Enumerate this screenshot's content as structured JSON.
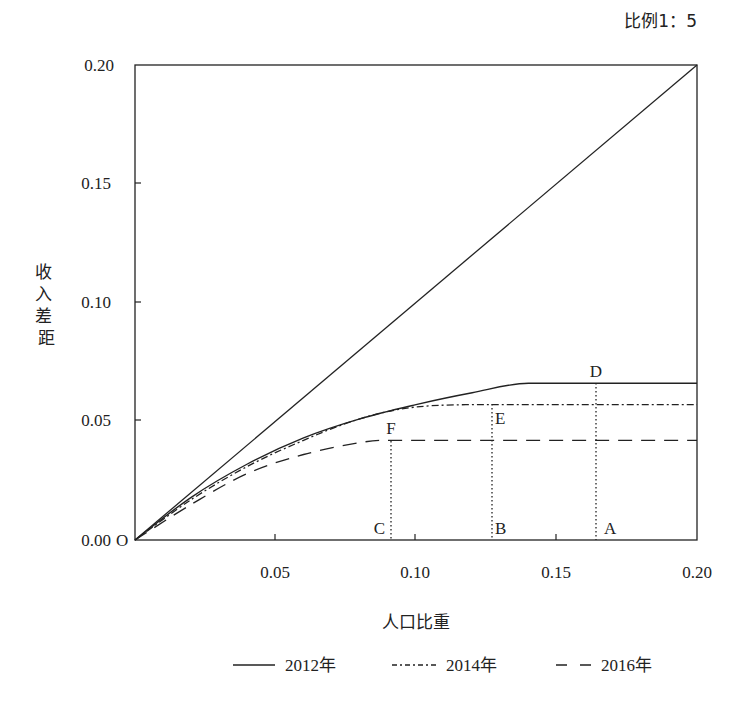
{
  "chart_data": {
    "type": "line",
    "title": "",
    "annotation_top_right": "比例1：5",
    "xlabel": "人口比重",
    "ylabel": "收入差距",
    "xlim": [
      0,
      0.2
    ],
    "ylim": [
      0,
      0.2
    ],
    "x_ticks": [
      "0.05",
      "0.10",
      "0.15",
      "0.20"
    ],
    "y_ticks": [
      "0.00",
      "0.05",
      "0.10",
      "0.15",
      "0.20"
    ],
    "origin_label": "O",
    "grid": false,
    "legend_position": "bottom",
    "reference_line": {
      "name": "比例1：5",
      "points": [
        [
          0,
          0
        ],
        [
          0.2,
          0.2
        ]
      ]
    },
    "series": [
      {
        "name": "2012年",
        "style": "solid",
        "x": [
          0,
          0.02,
          0.04,
          0.06,
          0.08,
          0.1,
          0.12,
          0.14,
          0.164,
          0.2
        ],
        "y": [
          0,
          0.018,
          0.032,
          0.043,
          0.051,
          0.057,
          0.062,
          0.066,
          0.066,
          0.066
        ]
      },
      {
        "name": "2014年",
        "style": "dash-dot",
        "x": [
          0,
          0.02,
          0.04,
          0.06,
          0.08,
          0.1,
          0.127,
          0.164,
          0.2
        ],
        "y": [
          0,
          0.017,
          0.031,
          0.042,
          0.051,
          0.056,
          0.057,
          0.057,
          0.057
        ]
      },
      {
        "name": "2016年",
        "style": "dashed",
        "x": [
          0,
          0.02,
          0.04,
          0.06,
          0.08,
          0.091,
          0.127,
          0.164,
          0.2
        ],
        "y": [
          0,
          0.015,
          0.028,
          0.036,
          0.041,
          0.042,
          0.042,
          0.042,
          0.042
        ]
      }
    ],
    "points": [
      {
        "label": "A",
        "x": 0.164,
        "y": 0
      },
      {
        "label": "B",
        "x": 0.127,
        "y": 0
      },
      {
        "label": "C",
        "x": 0.091,
        "y": 0
      },
      {
        "label": "D",
        "x": 0.164,
        "y": 0.066
      },
      {
        "label": "E",
        "x": 0.127,
        "y": 0.057
      },
      {
        "label": "F",
        "x": 0.091,
        "y": 0.042
      }
    ]
  },
  "legend": {
    "items": [
      {
        "label": "2012年",
        "style": "solid"
      },
      {
        "label": "2014年",
        "style": "dash-dot"
      },
      {
        "label": "2016年",
        "style": "dashed"
      }
    ]
  },
  "colors": {
    "line": "#222222",
    "background": "#ffffff"
  }
}
